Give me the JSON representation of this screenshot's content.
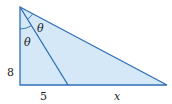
{
  "diagram": {
    "type": "right-triangle-angle-bisector",
    "colors": {
      "fill": "#d4e8f7",
      "stroke": "#2f6fb5",
      "text": "#1a1a1a"
    },
    "labels": {
      "vertical_side": "8",
      "base_left_segment": "5",
      "base_right_segment": "x",
      "angle_upper": "θ",
      "angle_lower": "θ"
    }
  }
}
